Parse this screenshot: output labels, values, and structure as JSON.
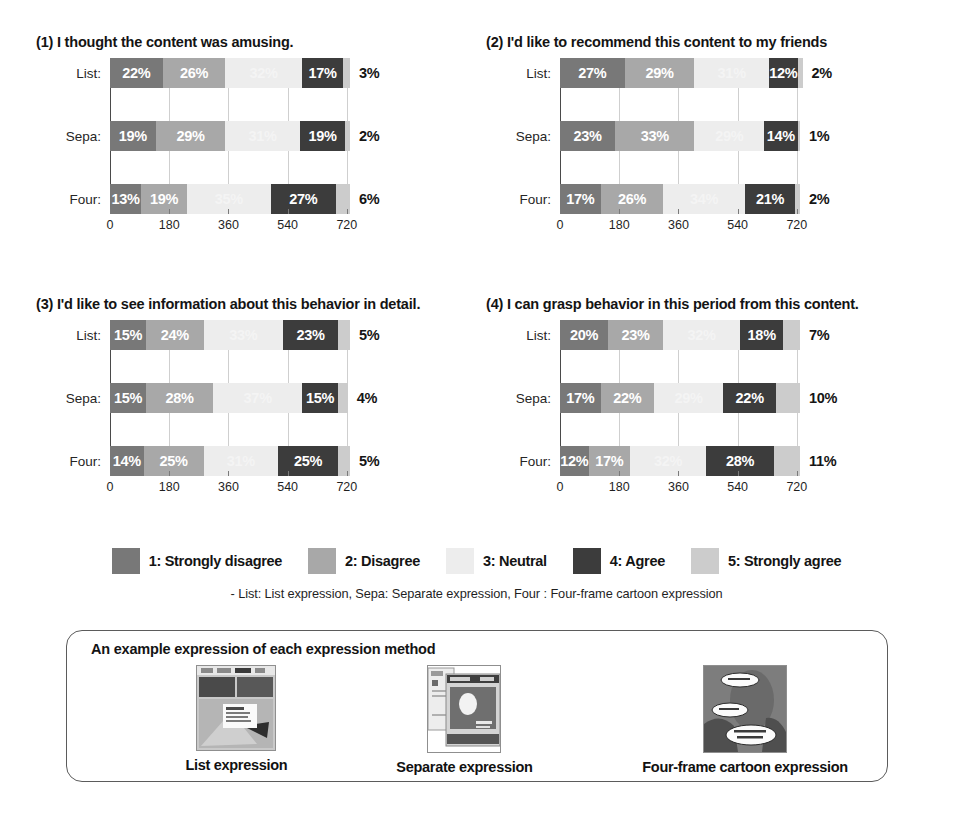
{
  "charts": [
    {
      "title": "(1) I thought the content was amusing.",
      "rows": [
        {
          "label": "List:",
          "values": [
            22,
            26,
            32,
            17,
            3
          ],
          "counts": [
            167,
            198,
            243,
            129,
            23
          ]
        },
        {
          "label": "Sepa:",
          "values": [
            19,
            29,
            31,
            19,
            2
          ],
          "counts": [
            144,
            220,
            236,
            144,
            16
          ]
        },
        {
          "label": "Four:",
          "values": [
            13,
            19,
            35,
            27,
            6
          ],
          "counts": [
            99,
            144,
            266,
            205,
            46
          ]
        }
      ]
    },
    {
      "title": "(2) I'd like to recommend this content to my friends",
      "rows": [
        {
          "label": "List:",
          "values": [
            27,
            29,
            31,
            12,
            2
          ],
          "counts": [
            205,
            220,
            236,
            91,
            16
          ]
        },
        {
          "label": "Sepa:",
          "values": [
            23,
            33,
            29,
            14,
            1
          ],
          "counts": [
            175,
            251,
            220,
            106,
            8
          ]
        },
        {
          "label": "Four:",
          "values": [
            17,
            26,
            34,
            21,
            2
          ],
          "counts": [
            129,
            198,
            258,
            160,
            16
          ]
        }
      ]
    },
    {
      "title": "(3) I'd like to see information about this behavior in detail.",
      "rows": [
        {
          "label": "List:",
          "values": [
            15,
            24,
            33,
            23,
            5
          ],
          "counts": [
            114,
            182,
            251,
            175,
            38
          ]
        },
        {
          "label": "Sepa:",
          "values": [
            15,
            28,
            37,
            15,
            4
          ],
          "counts": [
            114,
            213,
            281,
            114,
            30
          ]
        },
        {
          "label": "Four:",
          "values": [
            14,
            25,
            31,
            25,
            5
          ],
          "counts": [
            106,
            190,
            236,
            190,
            38
          ]
        }
      ]
    },
    {
      "title": "(4) I can grasp behavior in this period from this content.",
      "rows": [
        {
          "label": "List:",
          "values": [
            20,
            23,
            32,
            18,
            7
          ],
          "counts": [
            152,
            175,
            243,
            137,
            53
          ]
        },
        {
          "label": "Sepa:",
          "values": [
            17,
            22,
            29,
            22,
            10
          ],
          "counts": [
            129,
            167,
            220,
            167,
            76
          ]
        },
        {
          "label": "Four:",
          "values": [
            12,
            17,
            32,
            28,
            11
          ],
          "counts": [
            91,
            129,
            243,
            213,
            84
          ]
        }
      ]
    }
  ],
  "chart_data": {
    "type": "bar",
    "subtype": "stacked-horizontal-100percent",
    "xlabel": "",
    "ylabel": "",
    "xticks": [
      0,
      180,
      360,
      540,
      720
    ],
    "xlim": [
      0,
      760
    ],
    "grid": true,
    "legend_position": "bottom",
    "categories": [
      "List:",
      "Sepa:",
      "Four:"
    ],
    "series": [
      {
        "name": "1: Strongly disagree",
        "color": "#787878"
      },
      {
        "name": "2: Disagree",
        "color": "#a8a8a8"
      },
      {
        "name": "3: Neutral",
        "color": "#ededed"
      },
      {
        "name": "4: Agree",
        "color": "#3c3c3c"
      },
      {
        "name": "5: Strongly agree",
        "color": "#cccccc"
      }
    ],
    "panels": [
      {
        "title": "(1) I thought the content was amusing.",
        "categories": [
          "List:",
          "Sepa:",
          "Four:"
        ],
        "values_percent": [
          [
            22,
            26,
            32,
            17,
            3
          ],
          [
            19,
            29,
            31,
            19,
            2
          ],
          [
            13,
            19,
            35,
            27,
            6
          ]
        ]
      },
      {
        "title": "(2) I'd like to recommend this content to my friends",
        "categories": [
          "List:",
          "Sepa:",
          "Four:"
        ],
        "values_percent": [
          [
            27,
            29,
            31,
            12,
            2
          ],
          [
            23,
            33,
            29,
            14,
            1
          ],
          [
            17,
            26,
            34,
            21,
            2
          ]
        ]
      },
      {
        "title": "(3) I'd like to see information about this behavior in detail.",
        "categories": [
          "List:",
          "Sepa:",
          "Four:"
        ],
        "values_percent": [
          [
            15,
            24,
            33,
            23,
            5
          ],
          [
            15,
            28,
            37,
            15,
            4
          ],
          [
            14,
            25,
            31,
            25,
            5
          ]
        ]
      },
      {
        "title": "(4) I can grasp behavior in this period from this content.",
        "categories": [
          "List:",
          "Sepa:",
          "Four:"
        ],
        "values_percent": [
          [
            20,
            23,
            32,
            18,
            7
          ],
          [
            17,
            22,
            29,
            22,
            10
          ],
          [
            12,
            17,
            32,
            28,
            11
          ]
        ]
      }
    ]
  },
  "legend": {
    "items": [
      {
        "label": "1: Strongly disagree",
        "color": "#787878"
      },
      {
        "label": "2: Disagree",
        "color": "#a8a8a8"
      },
      {
        "label": "3: Neutral",
        "color": "#ededed"
      },
      {
        "label": "4: Agree",
        "color": "#3c3c3c"
      },
      {
        "label": "5: Strongly agree",
        "color": "#cccccc"
      }
    ],
    "note": "- List: List expression, Sepa: Separate expression, Four : Four-frame cartoon expression"
  },
  "example_panel": {
    "title": "An example expression of each expression method",
    "items": [
      {
        "caption": "List expression",
        "thumb": "list-expression-thumbnail"
      },
      {
        "caption": "Separate expression",
        "thumb": "separate-expression-thumbnail"
      },
      {
        "caption": "Four-frame cartoon expression",
        "thumb": "four-frame-cartoon-thumbnail"
      }
    ]
  }
}
